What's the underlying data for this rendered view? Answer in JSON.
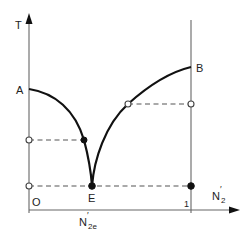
{
  "diagram": {
    "type": "phase-diagram-eutectic",
    "y_axis": {
      "label": "T"
    },
    "x_axis": {
      "label_main": "N",
      "label_main_prime": "′",
      "label_main_sub": "2",
      "origin_label": "O",
      "end_label": "1",
      "eutectic_comp_label": "N",
      "eutectic_comp_prime": "′",
      "eutectic_comp_sub": "2e"
    },
    "points": {
      "A": "A",
      "B": "B",
      "E": "E"
    },
    "colors": {
      "curve": "#111111",
      "axis": "#666666",
      "dash": "#555555",
      "background": "#ffffff"
    }
  }
}
